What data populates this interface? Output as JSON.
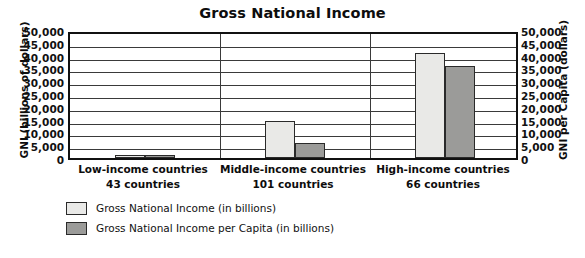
{
  "chart_data": {
    "type": "bar",
    "title": "Gross National Income",
    "xlabel": "",
    "ylabel": "GNI (billions of dollars)",
    "y2label": "GNI per Capita (dollars)",
    "ylim": [
      0,
      50000
    ],
    "y2lim": [
      0,
      50000
    ],
    "grid": true,
    "legend_position": "bottom-left",
    "categories": [
      "Low-income countries",
      "Middle-income countries",
      "High-income countries"
    ],
    "category_sublabels": [
      "43 countries",
      "101 countries",
      "66 countries"
    ],
    "tick_labels": [
      "50,000",
      "45,000",
      "40,000",
      "35,000",
      "30,000",
      "25,000",
      "20,000",
      "15,000",
      "10,000",
      "5,000",
      "0"
    ],
    "tick_values": [
      50000,
      45000,
      40000,
      35000,
      30000,
      25000,
      20000,
      15000,
      10000,
      5000,
      0
    ],
    "series": [
      {
        "name": "Gross National Income (in billions)",
        "color": "#e9e9e7",
        "values": [
          800,
          14500,
          41000
        ]
      },
      {
        "name": "Gross National Income per Capita (in billions)",
        "color": "#9b9b99",
        "values": [
          1000,
          6000,
          36000
        ]
      }
    ]
  },
  "legend": {
    "items": [
      {
        "label": "Gross National Income (in billions)",
        "swatch": "light"
      },
      {
        "label": "Gross National Income per Capita (in billions)",
        "swatch": "dark"
      }
    ]
  },
  "colors": {
    "light_bar": "#e9e9e7",
    "dark_bar": "#9b9b99",
    "frame": "#111111",
    "gridline": "#3a3a3a",
    "text": "#0d0d0d",
    "background": "#ffffff"
  }
}
